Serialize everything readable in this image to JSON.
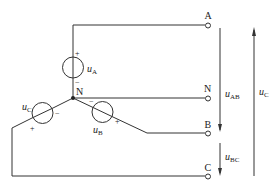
{
  "diagram": {
    "type": "three-phase Y-connected voltage sources",
    "nodes": {
      "terminal_a": "A",
      "terminal_n": "N",
      "terminal_b": "B",
      "terminal_c": "C",
      "neutral_junction": "N"
    },
    "sources": {
      "a": {
        "label": "u",
        "sub": "A",
        "plus": "+",
        "minus": "−"
      },
      "b": {
        "label": "u",
        "sub": "B",
        "plus": "+",
        "minus": "−"
      },
      "c": {
        "label": "u",
        "sub": "C",
        "plus": "+",
        "minus": "−"
      }
    },
    "voltages": {
      "uab": {
        "label": "u",
        "sub": "AB"
      },
      "ubc": {
        "label": "u",
        "sub": "BC"
      },
      "uc": {
        "label": "u",
        "sub": "C"
      }
    },
    "colors": {
      "line": "#333333",
      "background": "#ffffff"
    }
  }
}
